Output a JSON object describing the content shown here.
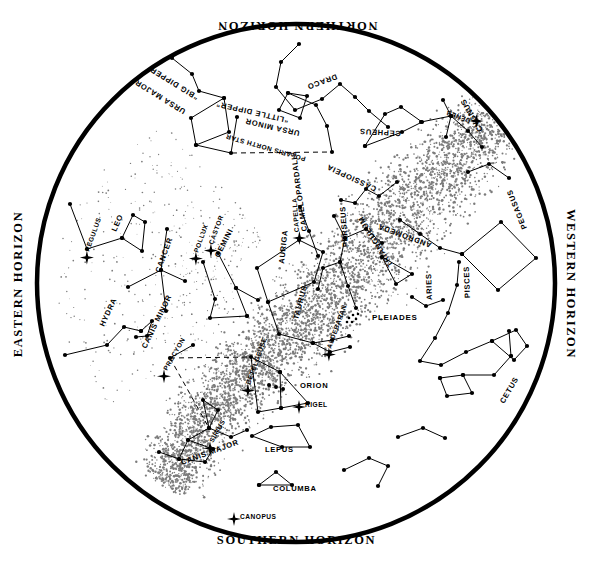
{
  "chart": {
    "type": "star-chart",
    "title_visible": false,
    "shape": "circular planisphere",
    "center": [
      296,
      283
    ],
    "radius": 262,
    "rim_stroke": "#000000",
    "background": "#ffffff",
    "milky_way_style": "stippled band"
  },
  "horizons": {
    "north": "NORTHERN HORIZON",
    "south": "SOUTHERN HORIZON",
    "east": "EASTERN HORIZON",
    "west": "WESTERN HORIZON"
  },
  "constellations": [
    {
      "name": "DRACO",
      "x": 336,
      "y": 74,
      "rot": 160
    },
    {
      "name": "URSA MAJOR",
      "x": 186,
      "y": 110,
      "rot": 212
    },
    {
      "name": "“BIG DIPPER”",
      "x": 199,
      "y": 96,
      "rot": 212
    },
    {
      "name": "URSA MINOR",
      "x": 300,
      "y": 131,
      "rot": 193
    },
    {
      "name": "“LITTLE DIPPER”",
      "x": 289,
      "y": 118,
      "rot": 193
    },
    {
      "name": "CEPHEUS",
      "x": 401,
      "y": 131,
      "rot": 183
    },
    {
      "name": "CASSIOPEIA",
      "x": 377,
      "y": 187,
      "rot": 205
    },
    {
      "name": "CYGNUS",
      "x": 483,
      "y": 130,
      "rot": 240
    },
    {
      "name": "PEGASUS",
      "x": 527,
      "y": 228,
      "rot": 248
    },
    {
      "name": "ANDROMEDA",
      "x": 432,
      "y": 243,
      "rot": 200
    },
    {
      "name": "TRIANGULUM",
      "x": 393,
      "y": 265,
      "rot": 238
    },
    {
      "name": "PERSEUS",
      "x": 348,
      "y": 247,
      "rot": 266
    },
    {
      "name": "ARIES",
      "x": 432,
      "y": 300,
      "rot": 268
    },
    {
      "name": "PISCES",
      "x": 470,
      "y": 298,
      "rot": 268
    },
    {
      "name": "CETUS",
      "x": 504,
      "y": 404,
      "rot": 300
    },
    {
      "name": "AURIGA",
      "x": 284,
      "y": 264,
      "rot": 276
    },
    {
      "name": "CAMELOPARDALIS",
      "x": 307,
      "y": 231,
      "rot": 262
    },
    {
      "name": "TAURUS",
      "x": 298,
      "y": 320,
      "rot": 285
    },
    {
      "name": "GEMINI",
      "x": 219,
      "y": 258,
      "rot": 297
    },
    {
      "name": "CANCER",
      "x": 160,
      "y": 273,
      "rot": 290
    },
    {
      "name": "LEO",
      "x": 116,
      "y": 232,
      "rot": 294
    },
    {
      "name": "HYDRA",
      "x": 104,
      "y": 327,
      "rot": 295
    },
    {
      "name": "CANIS MINOR",
      "x": 146,
      "y": 349,
      "rot": 296
    },
    {
      "name": "CANIS MAJOR",
      "x": 182,
      "y": 465,
      "rot": 340
    },
    {
      "name": "ORION",
      "x": 300,
      "y": 388,
      "rot": 0
    },
    {
      "name": "LEPUS",
      "x": 265,
      "y": 452,
      "rot": 0
    },
    {
      "name": "COLUMBA",
      "x": 273,
      "y": 491,
      "rot": 0
    }
  ],
  "named_stars": [
    {
      "name": "POLARIS NORTH STAR",
      "x": 306,
      "y": 157,
      "rot": 196,
      "marker": false
    },
    {
      "name": "DENEB",
      "x": 471,
      "y": 119,
      "rot": 200,
      "marker": true
    },
    {
      "name": "CAPELLA",
      "x": 299,
      "y": 232,
      "rot": 266,
      "marker": true
    },
    {
      "name": "ALDEBARAN",
      "x": 331,
      "y": 349,
      "rot": 290,
      "marker": true
    },
    {
      "name": "CASTOR",
      "x": 213,
      "y": 245,
      "rot": 290,
      "marker": true
    },
    {
      "name": "POLLUX",
      "x": 198,
      "y": 253,
      "rot": 290,
      "marker": true
    },
    {
      "name": "REGULUS",
      "x": 89,
      "y": 252,
      "rot": 290,
      "marker": true
    },
    {
      "name": "PROCYON",
      "x": 167,
      "y": 371,
      "rot": 300,
      "marker": true
    },
    {
      "name": "BETELGEUSE",
      "x": 250,
      "y": 385,
      "rot": 290,
      "marker": true
    },
    {
      "name": "RIGEL",
      "x": 305,
      "y": 407,
      "rot": 0,
      "marker": true
    },
    {
      "name": "SIRIUS",
      "x": 213,
      "y": 443,
      "rot": 300,
      "marker": true
    },
    {
      "name": "CANOPUS",
      "x": 240,
      "y": 519,
      "rot": 0,
      "marker": true
    }
  ],
  "clusters": [
    {
      "name": "PLEIADES",
      "x": 372,
      "y": 320,
      "rot": 0
    }
  ],
  "legend": {
    "bright_star_symbol": "cross-star",
    "star_symbol": "filled-dot",
    "cluster_symbol": "dot-group",
    "milky_way_symbol": "stipple"
  }
}
